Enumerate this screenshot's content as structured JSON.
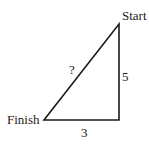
{
  "diagram": {
    "type": "right-triangle",
    "vertices": {
      "start": {
        "label": "Start"
      },
      "finish": {
        "label": "Finish"
      },
      "right_angle": {
        "label": ""
      }
    },
    "sides": {
      "vertical": {
        "label": "5"
      },
      "horizontal": {
        "label": "3"
      },
      "hypotenuse": {
        "label": "?"
      }
    },
    "colors": {
      "stroke": "#1a1a1a",
      "background": "#ffffff"
    }
  }
}
